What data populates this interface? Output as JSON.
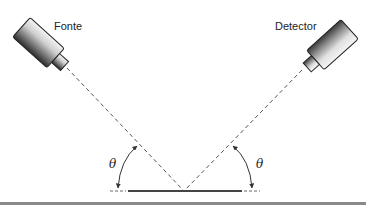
{
  "diagram": {
    "source_label": "Fonte",
    "detector_label": "Detector",
    "angle_left_label": "θ",
    "angle_right_label": "θ",
    "colors": {
      "line": "#333333",
      "dashed": "#555555",
      "surface": "#444444",
      "rule": "#8a8a8a"
    }
  }
}
